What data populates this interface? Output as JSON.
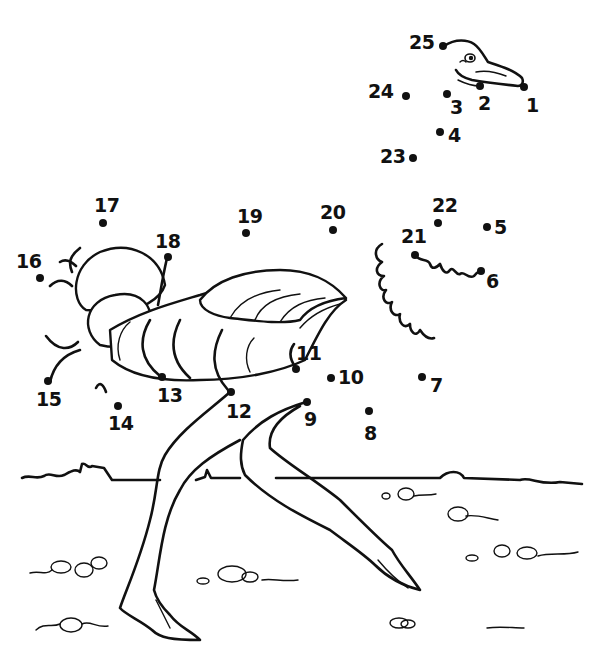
{
  "puzzle": {
    "type": "connect-the-dots",
    "subject": "ostrich",
    "ink_color": "#111111",
    "paper_color": "#ffffff",
    "dots": [
      {
        "n": "1"
      },
      {
        "n": "2"
      },
      {
        "n": "3"
      },
      {
        "n": "4"
      },
      {
        "n": "5"
      },
      {
        "n": "6"
      },
      {
        "n": "7"
      },
      {
        "n": "8"
      },
      {
        "n": "9"
      },
      {
        "n": "10"
      },
      {
        "n": "11"
      },
      {
        "n": "12"
      },
      {
        "n": "13"
      },
      {
        "n": "14"
      },
      {
        "n": "15"
      },
      {
        "n": "16"
      },
      {
        "n": "17"
      },
      {
        "n": "18"
      },
      {
        "n": "19"
      },
      {
        "n": "20"
      },
      {
        "n": "21"
      },
      {
        "n": "22"
      },
      {
        "n": "23"
      },
      {
        "n": "24"
      },
      {
        "n": "25"
      }
    ]
  }
}
